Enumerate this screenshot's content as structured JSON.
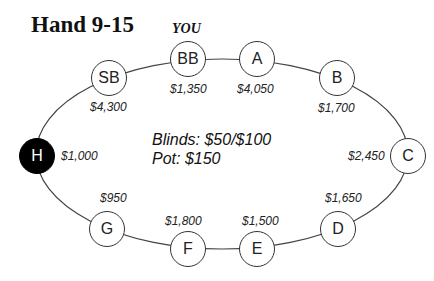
{
  "title": "Hand 9-15",
  "hero_label": "YOU",
  "info": {
    "blinds": "Blinds: $50/$100",
    "pot": "Pot: $150"
  },
  "seats": {
    "sb": {
      "label": "SB",
      "stack": "$4,300"
    },
    "bb": {
      "label": "BB",
      "stack": "$1,350"
    },
    "a": {
      "label": "A",
      "stack": "$4,050"
    },
    "b": {
      "label": "B",
      "stack": "$1,700"
    },
    "c": {
      "label": "C",
      "stack": "$2,450"
    },
    "d": {
      "label": "D",
      "stack": "$1,650"
    },
    "e": {
      "label": "E",
      "stack": "$1,500"
    },
    "f": {
      "label": "F",
      "stack": "$1,800"
    },
    "g": {
      "label": "G",
      "stack": "$950"
    },
    "h": {
      "label": "H",
      "stack": "$1,000"
    }
  },
  "colors": {
    "dealer_seat": "#000000",
    "seat_fill": "#ffffff",
    "line": "#333333"
  }
}
